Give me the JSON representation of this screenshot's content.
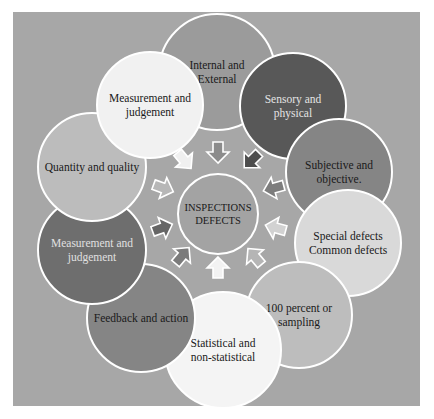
{
  "diagram": {
    "type": "radial-cycle",
    "panel": {
      "x": 13,
      "y": 12,
      "w": 407,
      "h": 394,
      "fill": "#a7a7a7"
    },
    "center": {
      "label_lines": [
        "INSPECTIONS",
        "DEFECTS"
      ],
      "cx": 218,
      "cy": 214,
      "r": 40,
      "fill": "#a3a3a3",
      "text_color": "#1a1a1a"
    },
    "nodes": [
      {
        "id": "internal-external",
        "lines": [
          "Internal and",
          "External"
        ],
        "cx": 217,
        "cy": 72,
        "r": 58,
        "fill": "#9b9b9b",
        "text": "#1a1a1a"
      },
      {
        "id": "sensory-physical",
        "lines": [
          "Sensory and",
          "physical"
        ],
        "cx": 293,
        "cy": 106,
        "r": 53,
        "fill": "#585858",
        "text": "#e4e4e4"
      },
      {
        "id": "subjective-objective",
        "lines": [
          "Subjective and",
          "objective."
        ],
        "cx": 339,
        "cy": 172,
        "r": 53,
        "fill": "#858585",
        "text": "#1a1a1a"
      },
      {
        "id": "special-common-defects",
        "lines": [
          "Special defects",
          "Common defects"
        ],
        "cx": 348,
        "cy": 243,
        "r": 53,
        "fill": "#d9d9d9",
        "text": "#1a1a1a"
      },
      {
        "id": "percent-sampling",
        "lines": [
          "100 percent or",
          "sampling"
        ],
        "cx": 299,
        "cy": 315,
        "r": 53,
        "fill": "#bdbdbd",
        "text": "#1a1a1a"
      },
      {
        "id": "statistical",
        "lines": [
          "Statistical and",
          "non-statistical"
        ],
        "cx": 223,
        "cy": 350,
        "r": 58,
        "fill": "#f4f4f4",
        "text": "#1a1a1a"
      },
      {
        "id": "feedback-action",
        "lines": [
          "Feedback and action"
        ],
        "cx": 141,
        "cy": 318,
        "r": 54,
        "fill": "#858585",
        "text": "#1a1a1a"
      },
      {
        "id": "measurement-judgement-dark",
        "lines": [
          "Measurement and",
          "judgement"
        ],
        "cx": 92,
        "cy": 250,
        "r": 54,
        "fill": "#6e6e6e",
        "text": "#e0e0e0"
      },
      {
        "id": "quantity-quality",
        "lines": [
          "Quantity and quality"
        ],
        "cx": 92,
        "cy": 167,
        "r": 54,
        "fill": "#bcbcbc",
        "text": "#1a1a1a"
      },
      {
        "id": "measurement-judgement-light",
        "lines": [
          "Measurement and",
          "judgement"
        ],
        "cx": 150,
        "cy": 105,
        "r": 53,
        "fill": "#f1f1f1",
        "text": "#1a1a1a"
      }
    ],
    "arrows": [
      {
        "id": "arrow-top",
        "cx": 218,
        "cy": 152,
        "angle": 180,
        "fill": "#8c8c8c"
      },
      {
        "id": "arrow-top-right",
        "cx": 252,
        "cy": 160,
        "angle": 225,
        "fill": "#4e4e4e"
      },
      {
        "id": "arrow-right-upper",
        "cx": 274,
        "cy": 188,
        "angle": 255,
        "fill": "#7d7d7d"
      },
      {
        "id": "arrow-right-lower",
        "cx": 276,
        "cy": 228,
        "angle": 285,
        "fill": "#d2d2d2"
      },
      {
        "id": "arrow-bottom-right",
        "cx": 255,
        "cy": 257,
        "angle": 320,
        "fill": "#b5b5b5"
      },
      {
        "id": "arrow-bottom",
        "cx": 218,
        "cy": 268,
        "angle": 0,
        "fill": "#f2f2f2"
      },
      {
        "id": "arrow-bottom-left",
        "cx": 182,
        "cy": 256,
        "angle": 40,
        "fill": "#7b7b7b"
      },
      {
        "id": "arrow-left-lower",
        "cx": 162,
        "cy": 228,
        "angle": 70,
        "fill": "#666666"
      },
      {
        "id": "arrow-left-upper",
        "cx": 163,
        "cy": 188,
        "angle": 110,
        "fill": "#b7b7b7"
      },
      {
        "id": "arrow-top-left",
        "cx": 184,
        "cy": 160,
        "angle": 140,
        "fill": "#f0f0f0"
      }
    ]
  }
}
